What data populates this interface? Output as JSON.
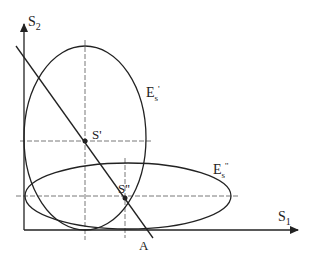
{
  "diagram": {
    "axes": {
      "x_label": "S",
      "x_sub": "1",
      "y_label": "S",
      "y_sub": "2"
    },
    "ellipses": [
      {
        "id": "E_s_prime",
        "label": "E",
        "sub": "s",
        "prime": "'"
      },
      {
        "id": "E_s_double_prime",
        "label": "E",
        "sub": "s",
        "prime": "''"
      }
    ],
    "points": [
      {
        "id": "S_prime",
        "label": "S'"
      },
      {
        "id": "S_double_prime",
        "label": "S''"
      }
    ],
    "line": {
      "label": "A"
    },
    "colors": {
      "stroke": "#222222",
      "dashed": "#555555",
      "background": "#ffffff"
    }
  }
}
